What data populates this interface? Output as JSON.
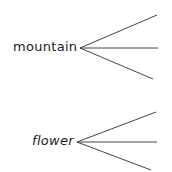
{
  "diagrams": [
    {
      "word": "mountain",
      "branches": 3
    },
    {
      "word": "flower",
      "branches": 3
    }
  ],
  "colors": {
    "line": "#444444",
    "text": "#222222"
  }
}
